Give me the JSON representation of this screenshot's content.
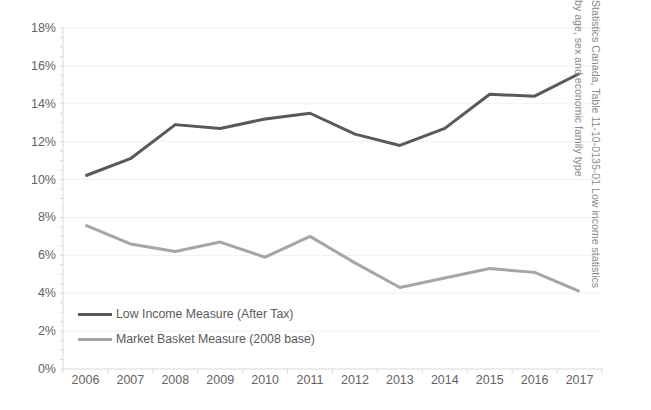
{
  "chart_data": {
    "type": "line",
    "title": "",
    "xlabel": "",
    "ylabel": "",
    "grid": true,
    "legend_position": "inside-bottom-left",
    "categories": [
      "2006",
      "2007",
      "2008",
      "2009",
      "2010",
      "2011",
      "2012",
      "2013",
      "2014",
      "2015",
      "2016",
      "2017"
    ],
    "ylim": [
      0,
      18
    ],
    "ytick_labels": [
      "0%",
      "2%",
      "4%",
      "6%",
      "8%",
      "10%",
      "12%",
      "14%",
      "16%",
      "18%"
    ],
    "ytick_values": [
      0,
      2,
      4,
      6,
      8,
      10,
      12,
      14,
      16,
      18
    ],
    "series": [
      {
        "name": "Low Income Measure (After Tax)",
        "color": "#595959",
        "values": [
          10.2,
          11.1,
          12.9,
          12.7,
          13.2,
          13.5,
          12.4,
          11.8,
          12.7,
          14.5,
          14.4,
          15.6
        ]
      },
      {
        "name": "Market Basket Measure (2008 base)",
        "color": "#a6a6a6",
        "values": [
          7.6,
          6.6,
          6.2,
          6.7,
          5.9,
          7.0,
          5.6,
          4.3,
          4.8,
          5.3,
          5.1,
          4.1
        ]
      }
    ],
    "annotations": []
  },
  "source": {
    "line1": "Statistics Canada, Table 11-10-0135-01 Low income statistics",
    "line2": "by age, sex and economic family type"
  },
  "colors": {
    "series_dark": "#595959",
    "series_light": "#a6a6a6",
    "gridline": "#f0f0f0",
    "axis": "#d9d9d9",
    "tick_text": "#636363",
    "source_text": "#8a8a8a"
  }
}
